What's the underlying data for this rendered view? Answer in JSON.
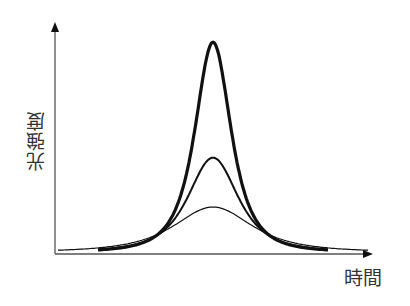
{
  "chart_data": {
    "type": "line",
    "title": "",
    "xlabel": "時間",
    "ylabel": "光強度",
    "grid": false,
    "legend": null,
    "axes": {
      "x_ticks": [],
      "y_ticks": [],
      "arrows": true
    },
    "series": [
      {
        "name": "thick (high peak, narrow)",
        "stroke_width": 3.2,
        "peak_x": 0.0,
        "peak_y": 1.0,
        "width": 0.115,
        "x_range": [
          -0.46,
          0.46
        ]
      },
      {
        "name": "medium (mid peak)",
        "stroke_width": 2.0,
        "peak_x": 0.0,
        "peak_y": 0.45,
        "width": 0.16,
        "x_range": [
          -0.46,
          0.46
        ]
      },
      {
        "name": "thin (low peak, broad)",
        "stroke_width": 1.2,
        "peak_x": 0.0,
        "peak_y": 0.215,
        "width": 0.25,
        "x_range": [
          -0.62,
          0.62
        ]
      }
    ],
    "annotations": []
  },
  "labels": {
    "x_axis": "時間",
    "y_axis": "光強度"
  }
}
